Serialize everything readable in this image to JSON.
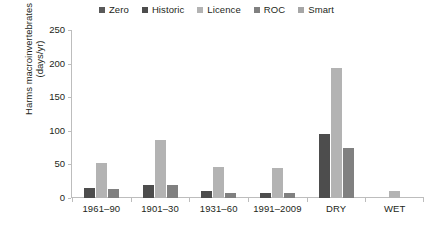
{
  "chart_data": {
    "type": "bar",
    "title": "",
    "xlabel": "",
    "ylabel": "Harms macroinvertebrates (days/yr)",
    "ylabel_line1": "Harms macroinvertebrates",
    "ylabel_line2": "(days/yr)",
    "ylim": [
      0,
      250
    ],
    "yticks": [
      250,
      200,
      150,
      100,
      50,
      0
    ],
    "grid": false,
    "legend_position": "top-center",
    "categories": [
      "1961–90",
      "1901–30",
      "1931–60",
      "1991–2009",
      "DRY",
      "WET"
    ],
    "series": [
      {
        "name": "Zero",
        "color": "#595959",
        "values": [
          0,
          0,
          0,
          0,
          0,
          0
        ]
      },
      {
        "name": "Historic",
        "color": "#4d4d4d",
        "values": [
          15,
          20,
          10,
          7,
          95,
          0
        ]
      },
      {
        "name": "Licence",
        "color": "#b3b3b3",
        "values": [
          52,
          87,
          46,
          44,
          193,
          11
        ]
      },
      {
        "name": "ROC",
        "color": "#808080",
        "values": [
          13,
          20,
          8,
          7,
          75,
          0
        ]
      },
      {
        "name": "Smart",
        "color": "#a6a6a6",
        "values": [
          0,
          0,
          0,
          0,
          0,
          0
        ]
      }
    ]
  },
  "colors": {
    "axis": "#bdbdbd",
    "text": "#231f20",
    "background": "#ffffff"
  }
}
